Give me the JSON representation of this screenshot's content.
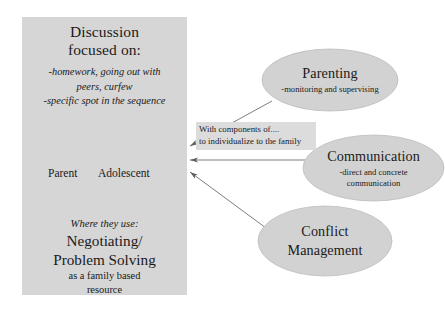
{
  "diagram": {
    "title_hidden": "",
    "colors": {
      "panel_fill": "#d6d6d6",
      "ellipse_fill": "#d2d2d2",
      "ellipse_stroke": "#b4b4b4",
      "cycle_arrow": "#6a6a6a",
      "connector_line": "#707070",
      "callout_fill": "#dcdcdc",
      "text": "#1a1a1a",
      "background": "#ffffff"
    },
    "panel": {
      "heading_line1": "Discussion",
      "heading_line2": "focused on:",
      "bullet_line1": "-homework, going out with",
      "bullet_line2": "peers, curfew",
      "bullet_line3": "-specific spot in the sequence",
      "cycle": {
        "left_label": "Parent",
        "right_label": "Adolescent",
        "top_arrow_name": "parent-to-adolescent-arrow",
        "bottom_arrow_name": "adolescent-to-parent-arrow"
      },
      "footer_line1": "Where they use:",
      "footer_line2": "Negotiating/",
      "footer_line3": "Problem Solving",
      "footer_line4": "as a family based",
      "footer_line5": "resource"
    },
    "callout": {
      "line1": "With components of....",
      "line2": "to individualize to the family"
    },
    "nodes": [
      {
        "id": "parenting",
        "title": "Parenting",
        "subtitle": "-monitoring and supervising"
      },
      {
        "id": "communication",
        "title": "Communication",
        "subtitle_line1": "-direct and concrete",
        "subtitle_line2": "communication"
      },
      {
        "id": "conflict",
        "title_line1": "Conflict",
        "title_line2": "Management",
        "subtitle": ""
      }
    ],
    "connectors": [
      {
        "name": "parenting-to-discussion-connector",
        "from": "parenting",
        "to": "discussion-panel"
      },
      {
        "name": "communication-to-discussion-connector",
        "from": "communication",
        "to": "discussion-panel"
      },
      {
        "name": "conflict-to-discussion-connector",
        "from": "conflict",
        "to": "discussion-panel"
      }
    ]
  }
}
